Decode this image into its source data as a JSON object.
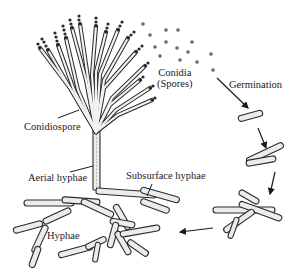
{
  "diagram": {
    "labels": {
      "conidiospore": "Conidiospore",
      "conidia_line1": "Conidia",
      "conidia_line2": "(Spores)",
      "germination": "Germination",
      "aerial_hyphae": "Aerial hyphae",
      "subsurface_hyphae": "Subsurface hyphae",
      "hyphae": "Hyphae"
    },
    "stages": [
      "Conidiospore",
      "Conidia (Spores)",
      "Germination",
      "Hyphae",
      "Aerial hyphae",
      "Subsurface hyphae"
    ],
    "colors": {
      "stroke": "#2a2a2a",
      "fill": "#ececec",
      "spore": "#6a6a6a",
      "background": "#ffffff"
    }
  }
}
